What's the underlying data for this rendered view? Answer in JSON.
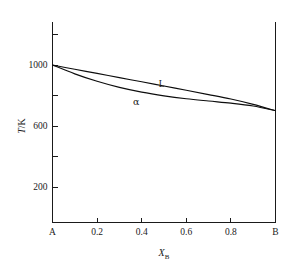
{
  "chart_data": {
    "type": "line",
    "title": "",
    "subtitle": "",
    "xlabel": "X_B",
    "xlabel_base": "X",
    "xlabel_sub": "B",
    "ylabel": "T/K",
    "ylabel_italic": "T",
    "ylabel_rest": "/K",
    "xlim": [
      0,
      1
    ],
    "ylim": [
      0,
      1200
    ],
    "grid": false,
    "legend": "inline-annotations",
    "x_tick_values": [
      0,
      0.2,
      0.4,
      0.6,
      0.8,
      1
    ],
    "x_tick_labels": [
      "A",
      "0.2",
      "0.4",
      "0.6",
      "0.8",
      "B"
    ],
    "x_major_ticks": [
      0.2,
      0.4,
      0.6,
      0.8
    ],
    "y_tick_values": [
      200,
      400,
      600,
      800,
      1000,
      1200
    ],
    "y_tick_labels": [
      "200",
      "",
      "600",
      "",
      "1000",
      ""
    ],
    "y_labeled_ticks": [
      {
        "value": 200,
        "label": "200"
      },
      {
        "value": 600,
        "label": "600"
      },
      {
        "value": 1000,
        "label": "1000"
      }
    ],
    "y_unlabeled_ticks": [
      400,
      800,
      1200
    ],
    "annotations": [
      {
        "text": "L",
        "x": 0.49,
        "y": 855,
        "name": "liquidus-label"
      },
      {
        "text": "α",
        "x": 0.375,
        "y": 735,
        "name": "alpha-phase-label"
      }
    ],
    "series": [
      {
        "name": "L",
        "description": "liquidus",
        "x": [
          0.0,
          0.1,
          0.2,
          0.3,
          0.4,
          0.5,
          0.6,
          0.7,
          0.8,
          0.9,
          1.0
        ],
        "y": [
          1000,
          972,
          945,
          917,
          890,
          862,
          834,
          806,
          777,
          742,
          700
        ]
      },
      {
        "name": "alpha",
        "description": "solidus",
        "x": [
          0.0,
          0.1,
          0.2,
          0.3,
          0.4,
          0.5,
          0.6,
          0.7,
          0.8,
          0.9,
          1.0
        ],
        "y": [
          1000,
          942,
          893,
          853,
          822,
          798,
          779,
          764,
          750,
          731,
          700
        ]
      }
    ]
  },
  "figure": {
    "background_color": "#ffffff",
    "line_color": "#0d0d0d",
    "axis_color": "#1a1a1a"
  }
}
